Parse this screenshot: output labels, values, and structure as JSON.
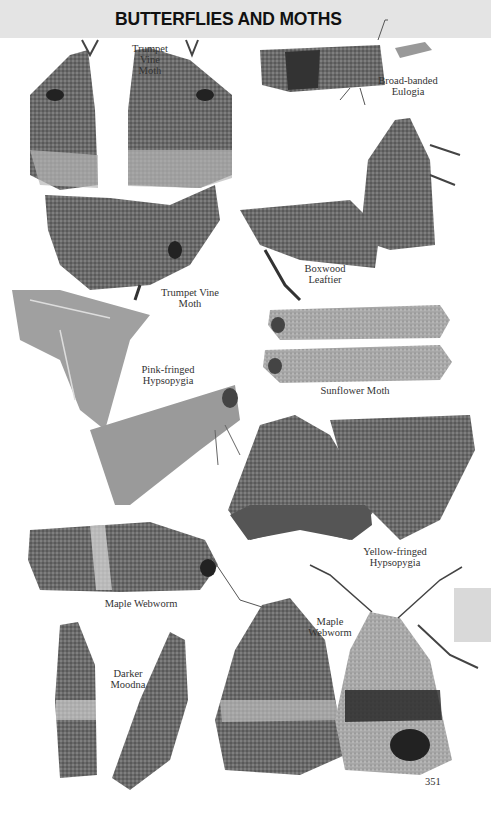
{
  "header": {
    "title": "BUTTERFLIES AND MOTHS"
  },
  "labels": {
    "trumpet_vine_1": "Trumpet\nVine\nMoth",
    "broad_banded": "Broad-banded\nEulogia",
    "boxwood": "Boxwood\nLeaftier",
    "trumpet_vine_2": "Trumpet Vine\nMoth",
    "pink_fringed": "Pink-fringed\nHypsopygia",
    "sunflower": "Sunflower Moth",
    "yellow_fringed": "Yellow-fringed\nHypsopygia",
    "maple_webworm_1": "Maple Webworm",
    "maple_webworm_2": "Maple\nWebworm",
    "darker_moodna": "Darker\nMoodna"
  },
  "page_number": "351",
  "colors": {
    "header_bg": "#e4e4e4",
    "tab_bg": "#d9d9d9",
    "text": "#333333"
  }
}
